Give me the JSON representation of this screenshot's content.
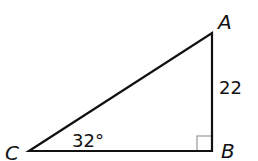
{
  "diagram": {
    "type": "right-triangle",
    "vertices": {
      "A": {
        "label": "A",
        "x": 212,
        "y": 33
      },
      "B": {
        "label": "B",
        "x": 212,
        "y": 151
      },
      "C": {
        "label": "C",
        "x": 29,
        "y": 151
      }
    },
    "angle_C_label": "32°",
    "side_AB_label": "22",
    "right_angle_at": "B",
    "stroke_color": "#111111",
    "right_angle_marker_color": "#999999"
  }
}
